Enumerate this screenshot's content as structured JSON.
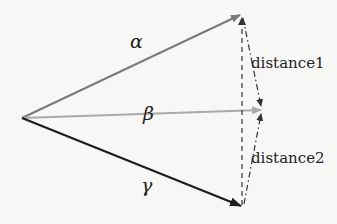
{
  "diagram": {
    "type": "vector-distance-diagram",
    "origin": {
      "x": 22,
      "y": 118
    },
    "vectors": [
      {
        "name": "alpha",
        "label": "α",
        "tip": {
          "x": 241,
          "y": 14
        },
        "color": "#7a7a7a",
        "label_pos": {
          "x": 130,
          "y": 34
        }
      },
      {
        "name": "beta",
        "label": "β",
        "tip": {
          "x": 262,
          "y": 110
        },
        "color": "#aaaaaa",
        "label_pos": {
          "x": 143,
          "y": 106
        }
      },
      {
        "name": "gamma",
        "label": "γ",
        "tip": {
          "x": 242,
          "y": 207
        },
        "color": "#1e1e1e",
        "label_pos": {
          "x": 141,
          "y": 176
        }
      }
    ],
    "distances": [
      {
        "name": "distance1",
        "label": "distance1",
        "from": "alpha",
        "to": "beta",
        "label_pos": {
          "x": 252,
          "y": 56
        }
      },
      {
        "name": "distance2",
        "label": "distance2",
        "from": "gamma",
        "to": "beta",
        "label_pos": {
          "x": 252,
          "y": 150
        }
      }
    ],
    "reference_line": {
      "style": "dashed",
      "from": "alpha",
      "to": "gamma",
      "color": "#333333"
    },
    "background": "#f7f7f5"
  }
}
